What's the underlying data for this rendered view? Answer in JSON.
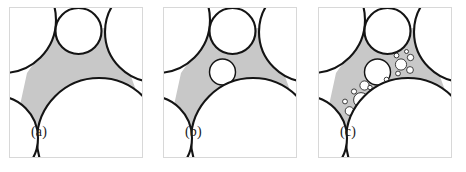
{
  "figure": {
    "kind": "apollonian-circle-packing-stages",
    "background_color": "#ffffff",
    "panel_border_color": "#d8d8d8",
    "curve_color": "#141414",
    "gap_fill_color": "#c8c8c8",
    "circle_fill_color": "#ffffff",
    "panel_width": 134,
    "panel_height": 151,
    "panels": [
      {
        "id": "a",
        "label": "(a)",
        "caption_position": "bottom-left",
        "stage": 0,
        "description": "Four mutually tangent large circles leaving one curvilinear-triangular interstice, shaded gray.",
        "generation_count": 0,
        "inscribed_circles": []
      },
      {
        "id": "b",
        "label": "(b)",
        "caption_position": "bottom-left",
        "stage": 1,
        "description": "Same four circles with the single largest inscribed circle added to the interstice.",
        "generation_count": 1,
        "inscribed_circles": [
          {
            "cx": 59.5,
            "cy": 65.0,
            "r": 13.0,
            "generation": 1
          }
        ]
      },
      {
        "id": "c",
        "label": "(c)",
        "caption_position": "bottom-left",
        "stage": 2,
        "description": "Several generations of inscribed circles forming an Apollonian gasket in the interstice.",
        "generation_count": 4,
        "inscribed_circles": [
          {
            "cx": 59.5,
            "cy": 65.0,
            "r": 13.0,
            "generation": 1
          },
          {
            "cx": 83.0,
            "cy": 57.5,
            "r": 5.6,
            "generation": 2
          },
          {
            "cx": 43.0,
            "cy": 93.0,
            "r": 7.4,
            "generation": 2
          },
          {
            "cx": 60.5,
            "cy": 88.0,
            "r": 5.2,
            "generation": 2
          },
          {
            "cx": 46.5,
            "cy": 78.5,
            "r": 4.6,
            "generation": 3
          },
          {
            "cx": 31.5,
            "cy": 104.0,
            "r": 4.3,
            "generation": 3
          },
          {
            "cx": 72.5,
            "cy": 80.0,
            "r": 3.6,
            "generation": 3
          },
          {
            "cx": 92.5,
            "cy": 50.5,
            "r": 3.2,
            "generation": 3
          },
          {
            "cx": 92.0,
            "cy": 63.0,
            "r": 3.4,
            "generation": 3
          },
          {
            "cx": 53.0,
            "cy": 99.5,
            "r": 3.6,
            "generation": 3
          },
          {
            "cx": 36.0,
            "cy": 84.5,
            "r": 2.6,
            "generation": 4
          },
          {
            "cx": 27.0,
            "cy": 94.5,
            "r": 2.4,
            "generation": 4
          },
          {
            "cx": 52.0,
            "cy": 80.5,
            "r": 2.2,
            "generation": 4
          },
          {
            "cx": 68.5,
            "cy": 72.5,
            "r": 2.3,
            "generation": 4
          },
          {
            "cx": 80.0,
            "cy": 66.5,
            "r": 2.4,
            "generation": 4
          },
          {
            "cx": 78.5,
            "cy": 48.5,
            "r": 2.4,
            "generation": 4
          },
          {
            "cx": 88.5,
            "cy": 44.5,
            "r": 2.0,
            "generation": 4
          },
          {
            "cx": 45.0,
            "cy": 103.5,
            "r": 2.2,
            "generation": 4
          },
          {
            "cx": 64.0,
            "cy": 95.0,
            "r": 2.3,
            "generation": 4
          },
          {
            "cx": 36.5,
            "cy": 109.0,
            "r": 2.1,
            "generation": 4
          }
        ]
      }
    ],
    "large_circles": [
      {
        "name": "upper-left",
        "cx": -6.0,
        "cy": 13.0,
        "r": 53.0
      },
      {
        "name": "upper-middle",
        "cx": 69.5,
        "cy": 24.0,
        "r": 23.0
      },
      {
        "name": "right",
        "cx": 146.0,
        "cy": 25.0,
        "r": 50.0
      },
      {
        "name": "lower-middle",
        "cx": 90.0,
        "cy": 133.0,
        "r": 62.0
      },
      {
        "name": "lower-left",
        "cx": -13.0,
        "cy": 131.0,
        "r": 42.0
      }
    ]
  }
}
